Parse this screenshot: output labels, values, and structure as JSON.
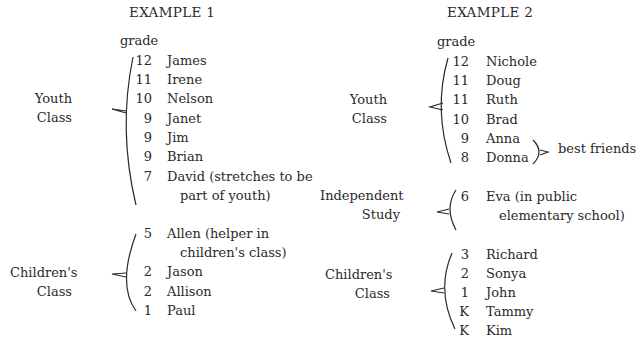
{
  "example1": {
    "title": "EXAMPLE 1",
    "grade_header": "grade",
    "groups": [
      {
        "label_lines": [
          "Youth",
          "Class"
        ],
        "rows": [
          {
            "grade": "12",
            "name": "James"
          },
          {
            "grade": "11",
            "name": "Irene"
          },
          {
            "grade": "10",
            "name": "Nelson"
          },
          {
            "grade": "9",
            "name": "Janet"
          },
          {
            "grade": "9",
            "name": "Jim"
          },
          {
            "grade": "9",
            "name": "Brian"
          },
          {
            "grade": "7",
            "name": "David (stretches to be",
            "cont": "part of youth)"
          }
        ]
      },
      {
        "label_lines": [
          "Children's",
          "Class"
        ],
        "rows": [
          {
            "grade": "5",
            "name": "Allen (helper in",
            "cont": "children's class)"
          },
          {
            "grade": "2",
            "name": "Jason"
          },
          {
            "grade": "2",
            "name": "Allison"
          },
          {
            "grade": "1",
            "name": "Paul"
          }
        ]
      }
    ]
  },
  "example2": {
    "title": "EXAMPLE 2",
    "grade_header": "grade",
    "groups": [
      {
        "label_lines": [
          "Youth",
          "Class"
        ],
        "rows": [
          {
            "grade": "12",
            "name": "Nichole"
          },
          {
            "grade": "11",
            "name": "Doug"
          },
          {
            "grade": "11",
            "name": "Ruth"
          },
          {
            "grade": "10",
            "name": "Brad"
          },
          {
            "grade": "9",
            "name": "Anna"
          },
          {
            "grade": "8",
            "name": "Donna"
          }
        ],
        "annotation": "best friends"
      },
      {
        "label_lines": [
          "Independent",
          "Study"
        ],
        "rows": [
          {
            "grade": "6",
            "name": "Eva (in public",
            "cont": "elementary school)"
          }
        ]
      },
      {
        "label_lines": [
          "Children's",
          "Class"
        ],
        "rows": [
          {
            "grade": "3",
            "name": "Richard"
          },
          {
            "grade": "2",
            "name": "Sonya"
          },
          {
            "grade": "1",
            "name": "John"
          },
          {
            "grade": "K",
            "name": "Tammy"
          },
          {
            "grade": "K",
            "name": "Kim"
          }
        ]
      }
    ]
  }
}
